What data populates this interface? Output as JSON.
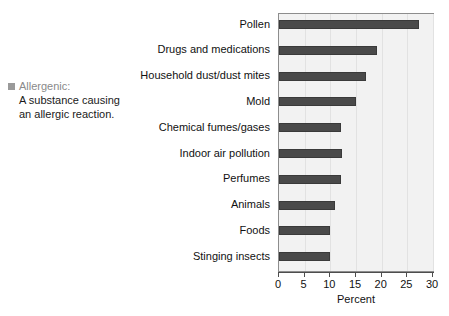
{
  "glossary": {
    "bullet_icon": "square-bullet-icon",
    "term": "Allergenic:",
    "definition": "A substance causing an allergic reaction."
  },
  "chart_data": {
    "type": "bar",
    "orientation": "horizontal",
    "title": "",
    "xlabel": "Percent",
    "ylabel": "",
    "xlim": [
      0,
      30
    ],
    "xticks": [
      0,
      5,
      10,
      15,
      20,
      25,
      30
    ],
    "grid": true,
    "legend": "none",
    "bar_color": "#4a4a4a",
    "plot_background": "#f2f2f2",
    "categories": [
      "Pollen",
      "Drugs and medications",
      "Household dust/dust mites",
      "Mold",
      "Chemical fumes/gases",
      "Indoor air pollution",
      "Perfumes",
      "Animals",
      "Foods",
      "Stinging insects"
    ],
    "values": [
      27.3,
      19.1,
      17.0,
      15.0,
      12.0,
      12.3,
      12.0,
      11.0,
      10.0,
      10.0
    ]
  }
}
